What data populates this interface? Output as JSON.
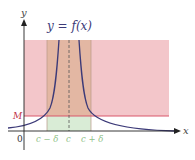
{
  "title": "y = f(x)",
  "labels": {
    "y_axis": "y",
    "x_axis": "x",
    "origin": "0",
    "M": "M",
    "c_minus_delta": "c − δ",
    "c": "c",
    "c_plus_delta": "c + δ"
  },
  "colors": {
    "pink_region": "#f3c6ca",
    "brown_band": "#e3b7a3",
    "green_band": "#d9ecd6",
    "curve": "#3c3a78",
    "M_line": "#d9566a",
    "axes": "#222222",
    "title_text": "#3c3a78",
    "tick_labels": "#8fbf88",
    "M_label": "#c0304a"
  }
}
